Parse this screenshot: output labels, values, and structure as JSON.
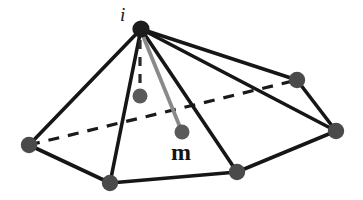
{
  "figure": {
    "background_color": "#ffffff",
    "width": 363,
    "height": 200
  },
  "labels": {
    "apex": "i",
    "interior": "m"
  },
  "colors": {
    "edge_solid": "#161616",
    "edge_dashed": "#1a1a1a",
    "node_base": "#4a4a4a",
    "node_apex": "#1c1c1c",
    "node_interior": "#5a5a5a",
    "edge_gray": "#8a8a8a",
    "text": "#141414"
  },
  "nodes": [
    {
      "id": "i",
      "name": "apex-node",
      "x": 141,
      "y": 29,
      "r": 8.5,
      "fill": "#1c1c1c"
    },
    {
      "id": "v1",
      "name": "base-node-left",
      "x": 29,
      "y": 145,
      "r": 8.0,
      "fill": "#4a4a4a"
    },
    {
      "id": "v2",
      "name": "base-node-bottomleft",
      "x": 110,
      "y": 183,
      "r": 8.0,
      "fill": "#4a4a4a"
    },
    {
      "id": "v3",
      "name": "base-node-bottomright",
      "x": 237,
      "y": 172,
      "r": 8.0,
      "fill": "#4a4a4a"
    },
    {
      "id": "v4",
      "name": "base-node-right",
      "x": 336,
      "y": 131,
      "r": 8.0,
      "fill": "#4a4a4a"
    },
    {
      "id": "v5",
      "name": "base-node-upperright",
      "x": 297,
      "y": 80,
      "r": 8.0,
      "fill": "#4a4a4a"
    },
    {
      "id": "a",
      "name": "axis-node",
      "x": 140,
      "y": 96,
      "r": 7.5,
      "fill": "#5a5a5a"
    },
    {
      "id": "m",
      "name": "interior-node-m",
      "x": 182,
      "y": 132,
      "r": 7.5,
      "fill": "#5a5a5a"
    }
  ],
  "edges": [
    {
      "name": "edge-i-v1",
      "from": "i",
      "to": "v1",
      "style": "solid",
      "color": "#161616",
      "width": 3.4
    },
    {
      "name": "edge-i-v2",
      "from": "i",
      "to": "v2",
      "style": "solid",
      "color": "#161616",
      "width": 3.4
    },
    {
      "name": "edge-i-v3",
      "from": "i",
      "to": "v3",
      "style": "solid",
      "color": "#161616",
      "width": 3.4
    },
    {
      "name": "edge-i-v4",
      "from": "i",
      "to": "v4",
      "style": "solid",
      "color": "#161616",
      "width": 3.4
    },
    {
      "name": "edge-i-v5",
      "from": "i",
      "to": "v5",
      "style": "solid",
      "color": "#161616",
      "width": 3.4
    },
    {
      "name": "edge-v1-v2",
      "from": "v1",
      "to": "v2",
      "style": "solid",
      "color": "#161616",
      "width": 3.4
    },
    {
      "name": "edge-v2-v3",
      "from": "v2",
      "to": "v3",
      "style": "solid",
      "color": "#161616",
      "width": 3.4
    },
    {
      "name": "edge-v3-v4",
      "from": "v3",
      "to": "v4",
      "style": "solid",
      "color": "#161616",
      "width": 3.4
    },
    {
      "name": "edge-v4-v5",
      "from": "v4",
      "to": "v5",
      "style": "solid",
      "color": "#161616",
      "width": 3.4
    },
    {
      "name": "edge-v1-v5-hidden",
      "from": "v1",
      "to": "v5",
      "style": "dashed",
      "color": "#1a1a1a",
      "width": 3.2,
      "dash": "11 9"
    },
    {
      "name": "edge-i-axis",
      "from": "i",
      "to": "a",
      "style": "dashed",
      "color": "#2a2a2a",
      "width": 3.2,
      "dash": "9 8"
    },
    {
      "name": "edge-i-m",
      "from": "i",
      "to": "m",
      "style": "solid",
      "color": "#8a8a8a",
      "width": 3.6
    }
  ]
}
